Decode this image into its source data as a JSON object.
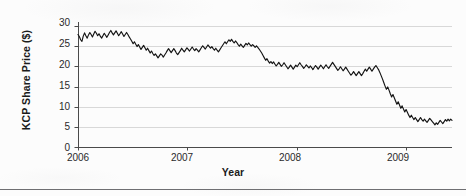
{
  "figure": {
    "background_color": "#fcfcfc",
    "line_color": "#141414",
    "grid_color": "#d8d8d8",
    "axis_color": "#4a4a4a",
    "text_color": "#1b1b1b"
  },
  "chart_data": {
    "type": "line",
    "title": "",
    "xlabel": "Year",
    "ylabel": "KCP Share Price ($)",
    "xlim": [
      2006.0,
      2009.42
    ],
    "ylim": [
      0,
      31
    ],
    "ytick_labels": [
      "0",
      "5",
      "10",
      "15",
      "20",
      "25",
      "30"
    ],
    "ytick_values": [
      0,
      5,
      10,
      15,
      20,
      25,
      30
    ],
    "xtick_labels": [
      "2006",
      "2007",
      "2008",
      "2009"
    ],
    "xtick_values": [
      2006,
      2007,
      2008,
      2009
    ],
    "grid": "horizontal",
    "legend": "none",
    "series": [
      {
        "name": "KCP Share Price",
        "x": [
          2006.0,
          2006.012,
          2006.024,
          2006.036,
          2006.048,
          2006.06,
          2006.072,
          2006.084,
          2006.096,
          2006.108,
          2006.12,
          2006.132,
          2006.144,
          2006.156,
          2006.168,
          2006.18,
          2006.192,
          2006.204,
          2006.216,
          2006.228,
          2006.24,
          2006.252,
          2006.264,
          2006.276,
          2006.288,
          2006.3,
          2006.312,
          2006.324,
          2006.336,
          2006.348,
          2006.36,
          2006.372,
          2006.384,
          2006.396,
          2006.408,
          2006.42,
          2006.432,
          2006.444,
          2006.456,
          2006.468,
          2006.48,
          2006.492,
          2006.504,
          2006.516,
          2006.528,
          2006.54,
          2006.552,
          2006.564,
          2006.576,
          2006.588,
          2006.6,
          2006.612,
          2006.624,
          2006.636,
          2006.648,
          2006.66,
          2006.672,
          2006.684,
          2006.696,
          2006.708,
          2006.72,
          2006.732,
          2006.744,
          2006.756,
          2006.768,
          2006.78,
          2006.792,
          2006.804,
          2006.816,
          2006.828,
          2006.84,
          2006.852,
          2006.864,
          2006.876,
          2006.888,
          2006.9,
          2006.912,
          2006.924,
          2006.936,
          2006.948,
          2006.96,
          2006.972,
          2006.984,
          2006.996,
          2007.008,
          2007.02,
          2007.032,
          2007.044,
          2007.056,
          2007.068,
          2007.08,
          2007.092,
          2007.104,
          2007.116,
          2007.128,
          2007.14,
          2007.152,
          2007.164,
          2007.176,
          2007.188,
          2007.2,
          2007.212,
          2007.224,
          2007.236,
          2007.248,
          2007.26,
          2007.272,
          2007.284,
          2007.296,
          2007.308,
          2007.32,
          2007.332,
          2007.344,
          2007.356,
          2007.368,
          2007.38,
          2007.392,
          2007.404,
          2007.416,
          2007.428,
          2007.44,
          2007.452,
          2007.464,
          2007.476,
          2007.488,
          2007.5,
          2007.512,
          2007.524,
          2007.536,
          2007.548,
          2007.56,
          2007.572,
          2007.584,
          2007.596,
          2007.608,
          2007.62,
          2007.632,
          2007.644,
          2007.656,
          2007.668,
          2007.68,
          2007.692,
          2007.704,
          2007.716,
          2007.728,
          2007.74,
          2007.752,
          2007.764,
          2007.776,
          2007.788,
          2007.8,
          2007.812,
          2007.824,
          2007.836,
          2007.848,
          2007.86,
          2007.872,
          2007.884,
          2007.896,
          2007.908,
          2007.92,
          2007.932,
          2007.944,
          2007.956,
          2007.968,
          2007.98,
          2007.992,
          2008.004,
          2008.016,
          2008.028,
          2008.04,
          2008.052,
          2008.064,
          2008.076,
          2008.088,
          2008.1,
          2008.112,
          2008.124,
          2008.136,
          2008.148,
          2008.16,
          2008.172,
          2008.184,
          2008.196,
          2008.208,
          2008.22,
          2008.232,
          2008.244,
          2008.256,
          2008.268,
          2008.28,
          2008.292,
          2008.304,
          2008.316,
          2008.328,
          2008.34,
          2008.352,
          2008.364,
          2008.376,
          2008.388,
          2008.4,
          2008.412,
          2008.424,
          2008.436,
          2008.448,
          2008.46,
          2008.472,
          2008.484,
          2008.496,
          2008.508,
          2008.52,
          2008.532,
          2008.544,
          2008.556,
          2008.568,
          2008.58,
          2008.592,
          2008.604,
          2008.616,
          2008.628,
          2008.64,
          2008.652,
          2008.664,
          2008.676,
          2008.688,
          2008.7,
          2008.712,
          2008.724,
          2008.736,
          2008.748,
          2008.76,
          2008.772,
          2008.784,
          2008.796,
          2008.808,
          2008.82,
          2008.832,
          2008.844,
          2008.856,
          2008.868,
          2008.88,
          2008.892,
          2008.904,
          2008.916,
          2008.928,
          2008.94,
          2008.952,
          2008.964,
          2008.976,
          2008.988,
          2009.0,
          2009.012,
          2009.024,
          2009.036,
          2009.048,
          2009.06,
          2009.072,
          2009.084,
          2009.096,
          2009.108,
          2009.12,
          2009.132,
          2009.144,
          2009.156,
          2009.168,
          2009.18,
          2009.192,
          2009.204,
          2009.216,
          2009.228,
          2009.24,
          2009.252,
          2009.264,
          2009.276,
          2009.288,
          2009.3,
          2009.312,
          2009.324,
          2009.336,
          2009.348,
          2009.36,
          2009.372,
          2009.384,
          2009.396,
          2009.408,
          2009.42
        ],
        "y": [
          27.9,
          27.4,
          26.6,
          26.2,
          27.5,
          28.3,
          27.6,
          27.0,
          27.8,
          28.4,
          27.9,
          27.3,
          28.0,
          28.7,
          28.2,
          27.6,
          28.1,
          27.5,
          27.0,
          27.6,
          28.2,
          27.7,
          27.2,
          27.8,
          28.4,
          28.9,
          28.3,
          27.8,
          28.3,
          28.8,
          28.2,
          27.6,
          28.1,
          28.6,
          28.0,
          27.4,
          27.9,
          28.4,
          27.9,
          27.3,
          26.8,
          26.2,
          25.6,
          26.1,
          25.5,
          24.9,
          25.4,
          24.8,
          24.2,
          24.7,
          25.2,
          24.6,
          24.0,
          24.5,
          23.9,
          23.3,
          23.8,
          23.2,
          22.7,
          23.1,
          22.6,
          22.1,
          22.6,
          23.1,
          22.8,
          22.3,
          22.8,
          23.3,
          23.9,
          24.4,
          23.9,
          23.4,
          23.9,
          24.4,
          23.9,
          23.3,
          22.9,
          23.4,
          23.9,
          24.5,
          24.0,
          23.6,
          24.1,
          24.6,
          24.2,
          23.8,
          24.3,
          24.8,
          24.3,
          23.9,
          24.4,
          24.0,
          23.6,
          24.1,
          24.6,
          25.1,
          24.7,
          24.3,
          24.8,
          25.3,
          24.9,
          24.5,
          24.9,
          24.4,
          24.0,
          24.5,
          24.0,
          23.6,
          24.1,
          24.6,
          25.1,
          25.6,
          26.1,
          25.6,
          26.1,
          26.6,
          26.2,
          26.7,
          26.2,
          25.8,
          26.3,
          25.9,
          25.4,
          25.0,
          25.5,
          25.1,
          24.7,
          25.2,
          25.7,
          25.3,
          25.8,
          25.4,
          25.0,
          25.4,
          25.1,
          24.7,
          25.1,
          24.7,
          24.3,
          23.8,
          23.3,
          22.7,
          22.1,
          21.5,
          21.9,
          21.3,
          20.8,
          21.2,
          20.7,
          21.1,
          20.6,
          20.1,
          20.5,
          21.0,
          20.5,
          20.0,
          20.4,
          20.9,
          20.4,
          19.9,
          19.4,
          19.8,
          20.3,
          19.8,
          19.3,
          19.8,
          20.3,
          19.9,
          20.4,
          20.9,
          20.4,
          20.0,
          19.5,
          19.9,
          20.4,
          20.0,
          19.6,
          20.1,
          19.7,
          19.2,
          19.7,
          20.2,
          19.8,
          19.3,
          19.8,
          20.3,
          19.9,
          19.4,
          19.9,
          20.4,
          19.9,
          19.5,
          20.0,
          20.5,
          21.0,
          20.5,
          20.0,
          19.5,
          19.0,
          19.4,
          19.9,
          19.4,
          18.9,
          19.3,
          19.8,
          19.3,
          18.8,
          18.3,
          17.8,
          18.2,
          18.7,
          18.2,
          17.7,
          18.2,
          18.7,
          18.2,
          17.7,
          18.2,
          18.8,
          19.3,
          18.8,
          19.3,
          19.8,
          19.3,
          18.8,
          19.3,
          19.8,
          20.2,
          19.7,
          19.2,
          18.5,
          17.7,
          16.9,
          16.0,
          15.1,
          14.3,
          14.9,
          14.1,
          13.2,
          12.4,
          13.0,
          12.2,
          11.4,
          10.6,
          11.2,
          10.4,
          9.6,
          10.2,
          9.4,
          8.7,
          9.3,
          8.6,
          7.9,
          7.3,
          7.9,
          7.3,
          6.8,
          7.3,
          6.8,
          6.3,
          6.8,
          7.3,
          6.8,
          6.4,
          6.9,
          6.5,
          6.1,
          6.6,
          7.1,
          6.7,
          6.3,
          5.9,
          5.5,
          6.0,
          5.6,
          6.1,
          6.6,
          6.2,
          5.8,
          6.3,
          6.8,
          6.4,
          6.9,
          6.5,
          6.9,
          6.6
        ]
      }
    ]
  },
  "layout": {
    "plot_left_px": 78,
    "plot_right_px": 452,
    "plot_top_px": 22,
    "plot_bottom_px": 147
  }
}
